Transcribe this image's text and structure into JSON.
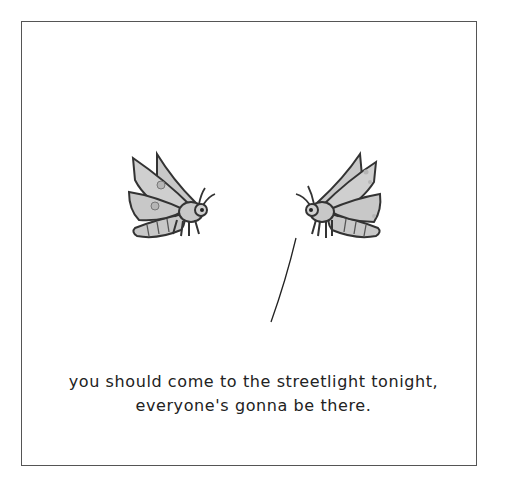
{
  "comic": {
    "caption_line1": "you should come to the streetlight tonight,",
    "caption_line2": "everyone's gonna be there.",
    "characters": [
      {
        "name": "moth-left",
        "facing": "right"
      },
      {
        "name": "moth-right",
        "facing": "left"
      }
    ],
    "colors": {
      "border": "#555555",
      "wing_fill": "#c8c8c8",
      "wing_inner": "#b0b0b0",
      "outline": "#333333",
      "text": "#222222"
    }
  }
}
